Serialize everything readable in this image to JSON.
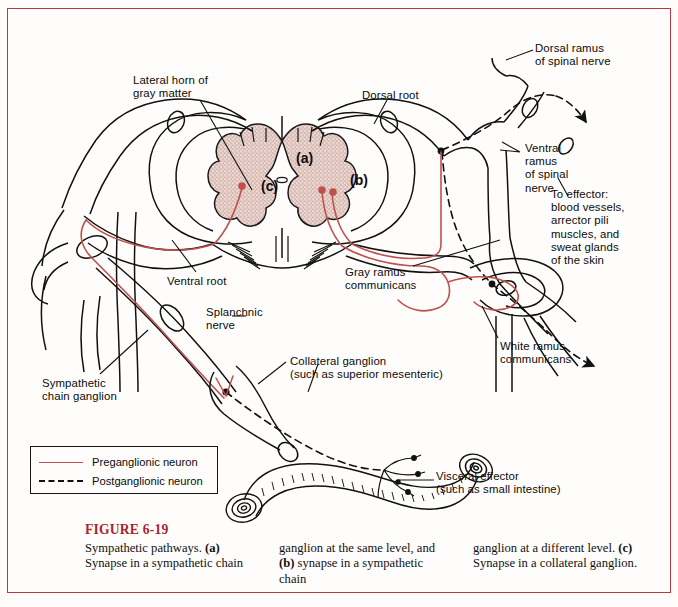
{
  "figure": {
    "number_label": "FIGURE 6-19",
    "accent_color": "#a3282f",
    "border_color": "#b5393f",
    "background_color": "#fefdfb",
    "preganglionic_color": "#c0504d",
    "postganglionic_color": "#111111",
    "gray_matter_fill": "#e8cfc9"
  },
  "caption": {
    "col1": "Sympathetic pathways. (a) Synapse in a sympathetic chain",
    "col2": "ganglion at the same level, and (b) synapse in a sympathetic chain",
    "col3": "ganglion at a different level. (c) Synapse in a collateral ganglion.",
    "col1_parts": {
      "lead": "Sympathetic pathways.",
      "bold": "(a)",
      "rest": " Synapse in a",
      "line3": "sympathetic chain"
    },
    "col2_parts": {
      "lead": "ganglion at the same",
      "line2a": "level, and ",
      "bold": "(b)",
      "line2b": " synapse in",
      "line3": "a sympathetic chain"
    },
    "col3_parts": {
      "lead": "ganglion at a different",
      "line2a": "level. ",
      "bold": "(c)",
      "line2b": " Synapse in a",
      "line3": "collateral ganglion."
    }
  },
  "legend": {
    "items": [
      {
        "label": "Preganglionic neuron",
        "style": "solid",
        "color": "#c0504d"
      },
      {
        "label": "Postganglionic neuron",
        "style": "dashed",
        "color": "#111111"
      }
    ]
  },
  "labels": [
    {
      "id": "lateral-horn",
      "text": "Lateral horn of\ngray matter",
      "x": 133,
      "y": 74
    },
    {
      "id": "dorsal-root",
      "text": "Dorsal root",
      "x": 362,
      "y": 89
    },
    {
      "id": "dorsal-ramus",
      "text": "Dorsal ramus\nof spinal nerve",
      "x": 535,
      "y": 42
    },
    {
      "id": "ventral-ramus",
      "text": "Ventral\nramus\nof spinal\nnerve",
      "x": 503,
      "y": 142
    },
    {
      "id": "to-effector",
      "text": "To effector:\nblood vessels,\narrector pili\nmuscles, and\nsweat glands\nof the skin",
      "x": 551,
      "y": 188
    },
    {
      "id": "ventral-root",
      "text": "Ventral root",
      "x": 167,
      "y": 275
    },
    {
      "id": "gray-ramus",
      "text": "Gray ramus\ncommunicans",
      "x": 345,
      "y": 266
    },
    {
      "id": "white-ramus",
      "text": "White ramus\ncommunicans",
      "x": 500,
      "y": 340
    },
    {
      "id": "splanchnic-nerve",
      "text": "Splanchnic\nnerve",
      "x": 206,
      "y": 312
    },
    {
      "id": "sympathetic-chain",
      "text": "Sympathetic\nchain ganglion",
      "x": 42,
      "y": 377
    },
    {
      "id": "collateral-ganglion",
      "text": "Collateral ganglion\n(such as superior mesenteric)",
      "x": 290,
      "y": 355
    },
    {
      "id": "visceral-effector",
      "text": "Visceral effector\n(such as small intestine)",
      "x": 436,
      "y": 476
    }
  ],
  "synapse_markers": [
    {
      "id": "marker-a",
      "text": "(a)",
      "x": 296,
      "y": 150
    },
    {
      "id": "marker-b",
      "text": "(b)",
      "x": 350,
      "y": 172
    },
    {
      "id": "marker-c",
      "text": "(c)",
      "x": 261,
      "y": 178
    }
  ]
}
